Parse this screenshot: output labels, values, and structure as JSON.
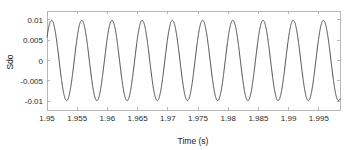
{
  "chart_data": {
    "type": "line",
    "title": "",
    "subtitle": "",
    "xlabel": "Time (s)",
    "ylabel": "Sdo",
    "xlim": [
      1.95,
      1.9985
    ],
    "ylim": [
      -0.0122,
      0.0122
    ],
    "xticks": [
      1.95,
      1.955,
      1.96,
      1.965,
      1.97,
      1.975,
      1.98,
      1.985,
      1.99,
      1.995
    ],
    "xticklabels": [
      "1.95",
      "1.955",
      "1.96",
      "1.965",
      "1.97",
      "1.975",
      "1.98",
      "1.985",
      "1.99",
      "1.995"
    ],
    "yticks": [
      0.01,
      0.005,
      0,
      -0.005,
      -0.01
    ],
    "yticklabels": [
      "0.01",
      "0.005",
      "0",
      "-0.005",
      "-0.01"
    ],
    "grid": false,
    "legend": null,
    "box": true,
    "tick_direction": "in",
    "line_color": "#4a4a4a",
    "line_width": 1.0,
    "axis_color": "#b0b0b0",
    "background": "#ffffff",
    "series": [
      {
        "name": "Sdo",
        "waveform": "sine",
        "amplitude": 0.0099,
        "frequency_hz": 200,
        "period_s": 0.005,
        "phase_rad": 0.62,
        "offset": 0.0,
        "n_cycles": 10,
        "sample_step": 2e-05,
        "peaks": [
          {
            "x": 1.9511,
            "y": 0.0099
          },
          {
            "x": 1.9561,
            "y": 0.0099
          },
          {
            "x": 1.9611,
            "y": 0.0099
          },
          {
            "x": 1.9661,
            "y": 0.0099
          },
          {
            "x": 1.9711,
            "y": 0.0099
          },
          {
            "x": 1.9761,
            "y": 0.0099
          },
          {
            "x": 1.9811,
            "y": 0.0099
          },
          {
            "x": 1.9861,
            "y": 0.0099
          },
          {
            "x": 1.9911,
            "y": 0.0099
          },
          {
            "x": 1.9961,
            "y": 0.0099
          }
        ],
        "troughs": [
          {
            "x": 1.9536,
            "y": -0.0099
          },
          {
            "x": 1.9586,
            "y": -0.0099
          },
          {
            "x": 1.9636,
            "y": -0.0099
          },
          {
            "x": 1.9686,
            "y": -0.0099
          },
          {
            "x": 1.9736,
            "y": -0.0099
          },
          {
            "x": 1.9786,
            "y": -0.0099
          },
          {
            "x": 1.9836,
            "y": -0.0099
          },
          {
            "x": 1.9886,
            "y": -0.0099
          },
          {
            "x": 1.9936,
            "y": -0.0099
          },
          {
            "x": 1.9986,
            "y": -0.0099
          }
        ],
        "start_point": {
          "x": 1.95,
          "y": 0.0058
        },
        "end_point": {
          "x": 1.9985,
          "y": -0.0099
        }
      }
    ]
  },
  "plot_box": {
    "left_px": 47,
    "top_px": 11,
    "right_px": 340,
    "bottom_px": 110
  }
}
